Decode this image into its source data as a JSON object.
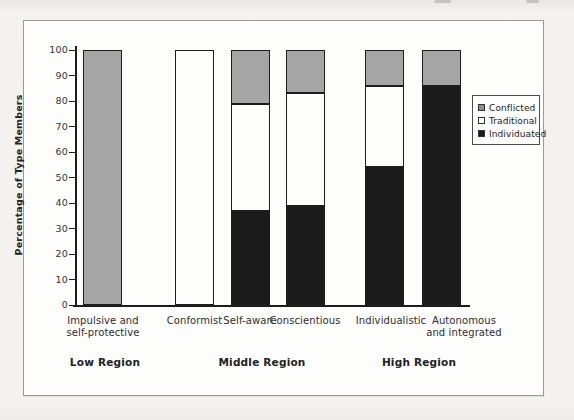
{
  "chart_data": {
    "type": "bar",
    "stacked": true,
    "title": "",
    "xlabel": "",
    "ylabel": "Percentage of Type Members",
    "ylim": [
      0,
      100
    ],
    "yticks": [
      0,
      10,
      20,
      30,
      40,
      50,
      60,
      70,
      80,
      90,
      100
    ],
    "grid": false,
    "categories": [
      "Impulsive and self-protective",
      "Conformist",
      "Self-aware",
      "Conscientious",
      "Individualistic",
      "Autonomous and integrated"
    ],
    "category_label_lines": [
      [
        "Impulsive and",
        "self-protective"
      ],
      [
        "Conformist"
      ],
      [
        "Self-aware"
      ],
      [
        "Conscientious"
      ],
      [
        "Individualistic"
      ],
      [
        "Autonomous",
        "and integrated"
      ]
    ],
    "series": [
      {
        "name": "Individuated",
        "color": "#1b1b1b",
        "values": [
          0,
          0,
          37,
          39,
          54,
          86
        ]
      },
      {
        "name": "Traditional",
        "color": "#fdfdfc",
        "values": [
          0,
          100,
          42,
          44,
          32,
          0
        ]
      },
      {
        "name": "Conflicted",
        "color": "#a5a5a5",
        "values": [
          100,
          0,
          21,
          17,
          14,
          14
        ]
      }
    ],
    "legend": {
      "position": "right",
      "entries": [
        {
          "label": "Conflicted",
          "color": "#8f8f8f"
        },
        {
          "label": "Traditional",
          "color": "#fdfdfc"
        },
        {
          "label": "Individuated",
          "color": "#1b1b1b"
        }
      ]
    },
    "region_groups": [
      {
        "label": "Low Region",
        "categories": [
          "Impulsive and self-protective"
        ]
      },
      {
        "label": "Middle Region",
        "categories": [
          "Conformist",
          "Self-aware",
          "Conscientious"
        ]
      },
      {
        "label": "High Region",
        "categories": [
          "Individualistic",
          "Autonomous and integrated"
        ]
      }
    ]
  }
}
